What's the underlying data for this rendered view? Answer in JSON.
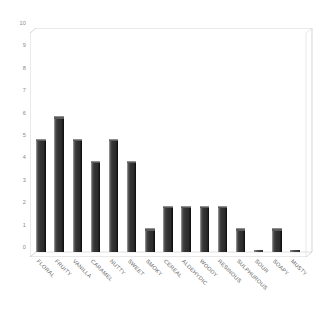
{
  "chart_data": {
    "type": "bar",
    "title": "",
    "subtitle": "",
    "xlabel": "",
    "ylabel": "",
    "categories": [
      "FLORAL",
      "FRUITY",
      "VANILLA",
      "CARAMEL",
      "NUTTY",
      "SWEET",
      "SMOKY",
      "CEREAL",
      "ALDEHYDIC",
      "WOODY",
      "RESINOUS",
      "SULPHUROUS",
      "SOUR",
      "SOAPY",
      "MUSTY"
    ],
    "values": [
      5,
      6,
      5,
      4,
      5,
      4,
      1,
      2,
      2,
      2,
      2,
      1,
      0,
      1,
      0
    ],
    "ylim": [
      0,
      10
    ],
    "ytick_labels": [
      "10",
      "9",
      "8",
      "7",
      "6",
      "5",
      "4",
      "3",
      "2",
      "1",
      "0"
    ],
    "ytick_values": [
      10,
      9,
      8,
      7,
      6,
      5,
      4,
      3,
      2,
      1,
      0
    ],
    "ytick_step": 1,
    "grid": false,
    "legend": false,
    "legend_position": "none",
    "bar_color": "#343434",
    "bar_highlight_color": "#9a9a9a",
    "bar_shadow_color": "#0d0d0d",
    "frame_color": "#b9b9b9",
    "axis_label_color": "#8a8a8a",
    "category_label_color": "#5e5e5e",
    "background_color": "#ffffff",
    "style": "3d-perspective-column",
    "xtick_label_rotation": 45
  }
}
